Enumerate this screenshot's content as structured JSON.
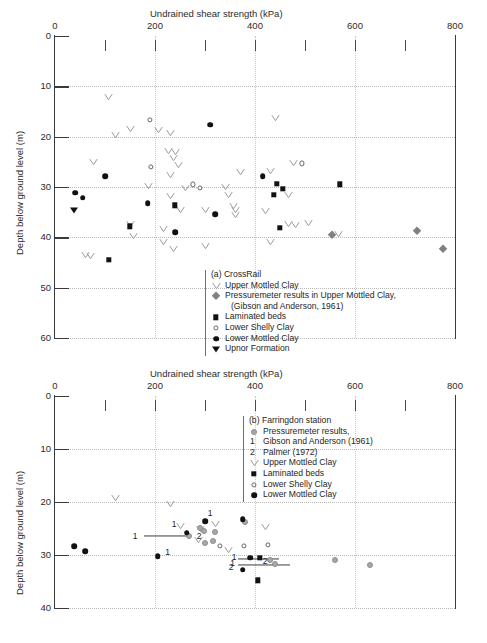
{
  "chart_data": [
    {
      "type": "scatter",
      "panel": "a",
      "title": "Undrained shear strength (kPa)",
      "xlabel": "Undrained shear strength (kPa)",
      "ylabel": "Depth below ground level (m)",
      "xlim": [
        0,
        800
      ],
      "ylim": [
        0,
        60
      ],
      "y_inverted": true,
      "grid": true,
      "legend_position": "inside-bottom-center",
      "xticks": [
        0,
        100,
        200,
        300,
        400,
        500,
        600,
        700,
        800
      ],
      "xtick_labels": [
        "0",
        "",
        "200",
        "",
        "400",
        "",
        "600",
        "",
        "800"
      ],
      "yticks": [
        0,
        10,
        20,
        30,
        40,
        50,
        60
      ],
      "ytick_labels": [
        "0",
        "10",
        "20",
        "30",
        "40",
        "50",
        "60"
      ],
      "legend_title": "(a)   CrossRail",
      "series": [
        {
          "name": "Upper Mottled Clay",
          "marker": "vee",
          "points": [
            [
              105,
              12.2
            ],
            [
              440,
              16.3
            ],
            [
              150,
              18.4
            ],
            [
              205,
              18.6
            ],
            [
              230,
              19.2
            ],
            [
              120,
              19.7
            ],
            [
              75,
              25.0
            ],
            [
              225,
              22.8
            ],
            [
              240,
              23.0
            ],
            [
              235,
              24.2
            ],
            [
              245,
              25.6
            ],
            [
              230,
              27.6
            ],
            [
              475,
              25.3
            ],
            [
              370,
              27.0
            ],
            [
              430,
              26.8
            ],
            [
              185,
              29.8
            ],
            [
              260,
              30.1
            ],
            [
              340,
              30.0
            ],
            [
              345,
              31.5
            ],
            [
              465,
              31.5
            ],
            [
              230,
              31.8
            ],
            [
              250,
              34.5
            ],
            [
              300,
              34.5
            ],
            [
              355,
              33.8
            ],
            [
              360,
              34.6
            ],
            [
              360,
              35.5
            ],
            [
              420,
              34.8
            ],
            [
              150,
              37.3
            ],
            [
              155,
              39.8
            ],
            [
              215,
              38.4
            ],
            [
              465,
              37.3
            ],
            [
              480,
              37.5
            ],
            [
              505,
              37.2
            ],
            [
              565,
              39.4
            ],
            [
              235,
              42.4
            ],
            [
              300,
              41.7
            ],
            [
              430,
              41.0
            ],
            [
              60,
              43.6
            ],
            [
              70,
              43.7
            ],
            [
              215,
              40.9
            ]
          ]
        },
        {
          "name": "Pressuremeter results in Upper Mottled Clay,",
          "name2": "(Gibson and Anderson, 1961)",
          "marker": "diamond-grey",
          "points": [
            [
              553,
              39.6
            ],
            [
              723,
              38.8
            ],
            [
              775,
              42.3
            ]
          ]
        },
        {
          "name": "Laminated beds",
          "marker": "square-filled",
          "points": [
            [
              150,
              37.8
            ],
            [
              240,
              33.6
            ],
            [
              108,
              44.5
            ],
            [
              455,
              30.3
            ],
            [
              437,
              31.5
            ],
            [
              443,
              29.4
            ],
            [
              570,
              29.5
            ],
            [
              450,
              38.1
            ]
          ]
        },
        {
          "name": "Lower Shelly Clay",
          "marker": "circle-open",
          "points": [
            [
              190,
              16.6
            ],
            [
              192,
              26.0
            ],
            [
              275,
              29.5
            ],
            [
              290,
              30.1
            ],
            [
              493,
              25.3
            ]
          ]
        },
        {
          "name": "Lower Mottled Clay",
          "marker": "circle-filled",
          "points": [
            [
              310,
              17.6
            ],
            [
              100,
              27.9
            ],
            [
              40,
              31.1
            ],
            [
              55,
              32.1
            ],
            [
              185,
              33.2
            ],
            [
              320,
              35.4
            ],
            [
              240,
              39.0
            ],
            [
              415,
              27.8
            ]
          ]
        },
        {
          "name": "Upnor Formation",
          "marker": "triangle-down",
          "points": [
            [
              38,
              34.6
            ]
          ]
        }
      ]
    },
    {
      "type": "scatter",
      "panel": "b",
      "title": "Undrained shear strength (kPa)",
      "xlabel": "Undrained shear strength (kPa)",
      "ylabel": "Depth below ground level (m)",
      "xlim": [
        0,
        800
      ],
      "ylim": [
        0,
        40
      ],
      "y_inverted": true,
      "grid": true,
      "legend_position": "inside-top-right",
      "xticks": [
        0,
        100,
        200,
        300,
        400,
        500,
        600,
        700,
        800
      ],
      "xtick_labels": [
        "0",
        "",
        "200",
        "",
        "400",
        "",
        "600",
        "",
        "800"
      ],
      "yticks": [
        0,
        10,
        20,
        30,
        40
      ],
      "ytick_labels": [
        "0",
        "10",
        "20",
        "30",
        "40"
      ],
      "legend_title": "(b)   Farringdon station",
      "legend_extra": [
        "Pressuremeter results,",
        "1   Gibson and Anderson (1961)",
        "2   Palmer (1972)"
      ],
      "series": [
        {
          "name": "Upper Mottled Clay",
          "marker": "vee",
          "points": [
            [
              120,
              19.3
            ],
            [
              230,
              20.4
            ],
            [
              250,
              24.6
            ],
            [
              320,
              24.2
            ],
            [
              290,
              25.0
            ],
            [
              285,
              27.2
            ],
            [
              345,
              29.0
            ],
            [
              420,
              24.7
            ]
          ]
        },
        {
          "name": "Pressuremeter results,",
          "marker": "circle-grey",
          "points": [
            [
              268,
              26.4
            ],
            [
              290,
              24.9
            ],
            [
              320,
              25.6
            ],
            [
              300,
              27.8
            ],
            [
              315,
              27.3
            ],
            [
              380,
              23.7
            ],
            [
              430,
              30.9
            ],
            [
              440,
              31.7
            ],
            [
              560,
              30.9
            ],
            [
              630,
              31.9
            ],
            [
              298,
              25.4
            ]
          ]
        },
        {
          "name": "Laminated beds",
          "marker": "square-filled",
          "points": [
            [
              410,
              30.5
            ],
            [
              405,
              34.8
            ]
          ]
        },
        {
          "name": "Lower Shelly Clay",
          "marker": "circle-open",
          "points": [
            [
              330,
              28.3
            ],
            [
              378,
              28.3
            ],
            [
              425,
              28.1
            ]
          ]
        },
        {
          "name": "Lower Mottled Clay",
          "marker": "circle-filled",
          "points": [
            [
              38,
              28.3
            ],
            [
              60,
              29.3
            ],
            [
              205,
              30.2
            ],
            [
              263,
              25.8
            ],
            [
              300,
              23.6
            ],
            [
              375,
              23.3
            ],
            [
              390,
              30.5
            ],
            [
              375,
              32.8
            ]
          ]
        }
      ],
      "annotations": [
        {
          "label": "1",
          "x": 238,
          "y": 24.2
        },
        {
          "label": "1",
          "x": 310,
          "y": 22.1
        },
        {
          "label": "1",
          "x": 160,
          "y": 26.4
        },
        {
          "label": "2",
          "x": 288,
          "y": 26.4
        },
        {
          "label": "1",
          "x": 225,
          "y": 29.4
        },
        {
          "label": "1",
          "x": 358,
          "y": 30.4
        },
        {
          "label": "1",
          "x": 355,
          "y": 31.6
        },
        {
          "label": "2",
          "x": 420,
          "y": 31.2
        },
        {
          "label": "2",
          "x": 352,
          "y": 32.2
        }
      ],
      "error_bars": [
        {
          "y": 26.4,
          "x_start": 178,
          "x_end": 270
        },
        {
          "y": 30.8,
          "x_start": 365,
          "x_end": 447
        },
        {
          "y": 31.9,
          "x_start": 365,
          "x_end": 470
        }
      ]
    }
  ],
  "panel_a": {
    "xlabel": "Undrained shear strength (kPa)",
    "ylabel": "Depth below ground level (m)",
    "xtick_labels": [
      "0",
      "200",
      "400",
      "600",
      "800"
    ],
    "ytick_labels": [
      "0",
      "10",
      "20",
      "30",
      "40",
      "50",
      "60"
    ],
    "legend": {
      "header": "(a)   CrossRail",
      "items": [
        {
          "symbol": "vee",
          "label": "Upper Mottled Clay"
        },
        {
          "symbol": "diamond-grey",
          "label": "Pressuremeter results in Upper Mottled Clay,"
        },
        {
          "symbol": "none",
          "label": "(Gibson and Anderson, 1961)"
        },
        {
          "symbol": "square-filled",
          "label": "Laminated beds"
        },
        {
          "symbol": "circle-open",
          "label": "Lower Shelly Clay"
        },
        {
          "symbol": "circle-filled",
          "label": "Lower Mottled Clay"
        },
        {
          "symbol": "triangle-down",
          "label": "Upnor Formation"
        }
      ]
    }
  },
  "panel_b": {
    "xlabel": "Undrained shear strength (kPa)",
    "ylabel": "Depth below ground level (m)",
    "xtick_labels": [
      "0",
      "200",
      "400",
      "600",
      "800"
    ],
    "ytick_labels": [
      "0",
      "10",
      "20",
      "30",
      "40"
    ],
    "legend": {
      "header": "(b)   Farringdon station",
      "items": [
        {
          "symbol": "circle-grey",
          "label": "Pressuremeter results,"
        },
        {
          "symbol": "num1",
          "label": "Gibson and Anderson (1961)"
        },
        {
          "symbol": "num2",
          "label": "Palmer (1972)"
        },
        {
          "symbol": "vee",
          "label": "Upper Mottled Clay"
        },
        {
          "symbol": "square-filled",
          "label": "Laminated beds"
        },
        {
          "symbol": "circle-open",
          "label": "Lower Shelly Clay"
        },
        {
          "symbol": "circle-filled",
          "label": "Lower Mottled Clay"
        }
      ]
    }
  },
  "colors": {
    "axis": "#3a3a3a",
    "grid": "#bdbdbd",
    "marker_dark": "#111111",
    "marker_grey": "#a8a8a8",
    "marker_diamond": "#808080",
    "marker_vee": "#9a9a9a",
    "text": "#262626"
  }
}
